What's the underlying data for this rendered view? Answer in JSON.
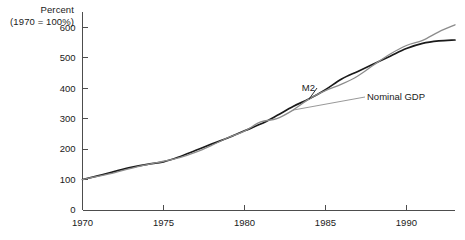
{
  "chart_data": {
    "type": "line",
    "title": "",
    "subtitle": "",
    "xlabel": "",
    "ylabel": "Percent",
    "ylabel_note": "(1970 = 100%)",
    "grid": false,
    "legend_position": "inline-annotations",
    "xlim": [
      1970,
      1993
    ],
    "ylim": [
      0,
      650
    ],
    "yticks": [
      0,
      100,
      200,
      300,
      400,
      500,
      600
    ],
    "ytick_labels": [
      "0",
      "100",
      "200",
      "300",
      "400",
      "500",
      "600"
    ],
    "xticks": [
      1970,
      1975,
      1980,
      1985,
      1990
    ],
    "xtick_labels": [
      "1970",
      "1975",
      "1980",
      "1985",
      "1990"
    ],
    "x": [
      1970,
      1971,
      1972,
      1973,
      1974,
      1975,
      1976,
      1977,
      1978,
      1979,
      1980,
      1981,
      1982,
      1983,
      1984,
      1985,
      1986,
      1987,
      1988,
      1989,
      1990,
      1991,
      1992,
      1993
    ],
    "series": [
      {
        "name": "M2",
        "color": "#1a1a1a",
        "label_annotation": "M2",
        "values": [
          100,
          113,
          127,
          140,
          150,
          158,
          175,
          196,
          217,
          237,
          260,
          282,
          310,
          340,
          365,
          395,
          430,
          455,
          480,
          505,
          530,
          547,
          555,
          558
        ]
      },
      {
        "name": "Nominal GDP",
        "color": "#8c8c8c",
        "label_annotation": "Nominal GDP",
        "values": [
          100,
          111,
          123,
          137,
          149,
          160,
          172,
          190,
          213,
          238,
          259,
          289,
          300,
          328,
          365,
          392,
          413,
          440,
          477,
          512,
          540,
          557,
          585,
          608
        ]
      }
    ],
    "annotations": [
      {
        "text": "M2",
        "series": "M2"
      },
      {
        "text": "Nominal GDP",
        "series": "Nominal GDP"
      }
    ]
  }
}
